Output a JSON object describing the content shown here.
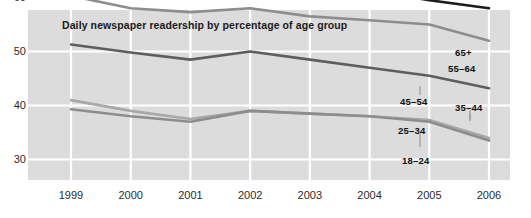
{
  "chart_data": {
    "type": "line",
    "title": "Daily newspaper readership by percentage of age group",
    "xlabel": "",
    "ylabel": "",
    "x": [
      1999,
      2000,
      2001,
      2002,
      2003,
      2004,
      2005,
      2006
    ],
    "xticklabels": [
      "1999",
      "2000",
      "2001",
      "2002",
      "2003",
      "2004",
      "2005",
      "2006"
    ],
    "yticklabels": [
      "70",
      "60",
      "50",
      "40",
      "30"
    ],
    "yticks": [
      70,
      60,
      50,
      40,
      30
    ],
    "ylim": [
      25,
      74
    ],
    "xlim": [
      1999,
      2006
    ],
    "grid": true,
    "legend_position": "inline-right",
    "series": [
      {
        "name": "65+",
        "color": "#8d8d8d",
        "values": [
          70.0,
          70.0,
          70.0,
          70.0,
          69.0,
          68.0,
          67.0,
          66.0
        ]
      },
      {
        "name": "55–64",
        "color": "#1c1c1c",
        "values": [
          66.0,
          63.3,
          63.2,
          63.3,
          61.5,
          61.3,
          59.5,
          58.0
        ]
      },
      {
        "name": "45–54",
        "color": "#8d8d8d",
        "values": [
          60.3,
          58.0,
          57.3,
          58.0,
          56.5,
          55.8,
          55.0,
          52.0
        ]
      },
      {
        "name": "35–44",
        "color": "#5e5e5e",
        "values": [
          51.3,
          49.8,
          48.5,
          50.0,
          48.5,
          47.0,
          45.5,
          43.2
        ]
      },
      {
        "name": "25–34",
        "color": "#a8a8a8",
        "values": [
          41.0,
          39.0,
          37.5,
          39.0,
          38.5,
          38.0,
          37.3,
          34.0
        ]
      },
      {
        "name": "18–24",
        "color": "#8d8d8d",
        "values": [
          39.3,
          38.0,
          37.0,
          39.0,
          38.5,
          38.0,
          37.0,
          33.5
        ]
      }
    ],
    "annotations": [
      {
        "text": "65+",
        "x": 455,
        "y": 47
      },
      {
        "text": "55–64",
        "x": 448,
        "y": 63
      },
      {
        "text": "45–54",
        "x": 400,
        "y": 96
      },
      {
        "text": "35–44",
        "x": 455,
        "y": 102
      },
      {
        "text": "25–34",
        "x": 398,
        "y": 125
      },
      {
        "text": "18–24",
        "x": 402,
        "y": 155
      }
    ]
  },
  "style": {
    "panel_color": "#dcdcdc",
    "grid_color": "#ffffff",
    "background": "#ffffff",
    "text_color": "#2b2b2b"
  }
}
